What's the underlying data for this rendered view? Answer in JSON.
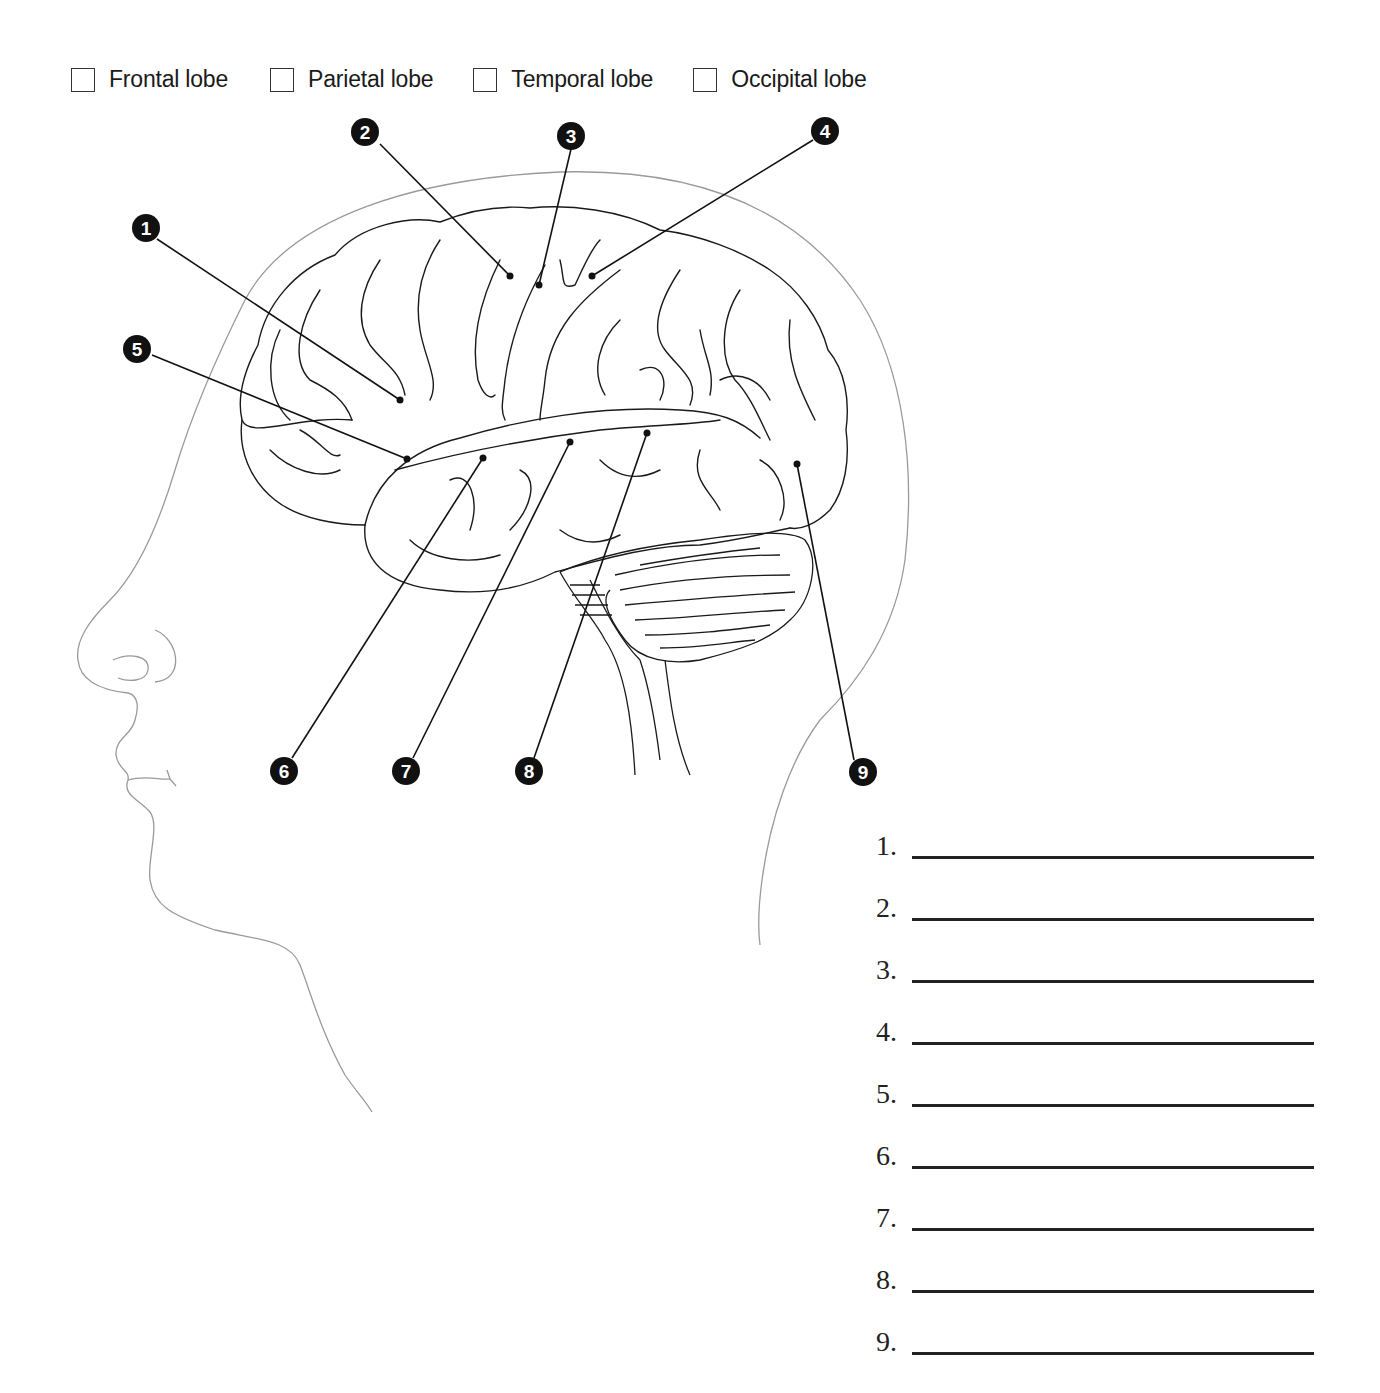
{
  "legend": {
    "items": [
      {
        "label": "Frontal lobe",
        "checked": false
      },
      {
        "label": "Parietal lobe",
        "checked": false
      },
      {
        "label": "Temporal lobe",
        "checked": false
      },
      {
        "label": "Occipital lobe",
        "checked": false
      }
    ]
  },
  "diagram": {
    "callouts": [
      {
        "number": "1",
        "marker": [
          400,
          400
        ],
        "label_pos": [
          146,
          228
        ]
      },
      {
        "number": "2",
        "marker": [
          510,
          276
        ],
        "label_pos": [
          365,
          132
        ]
      },
      {
        "number": "3",
        "marker": [
          539,
          285
        ],
        "label_pos": [
          571,
          136
        ]
      },
      {
        "number": "4",
        "marker": [
          592,
          276
        ],
        "label_pos": [
          825,
          131
        ]
      },
      {
        "number": "5",
        "marker": [
          407,
          459
        ],
        "label_pos": [
          137,
          349
        ]
      },
      {
        "number": "6",
        "marker": [
          483,
          458
        ],
        "label_pos": [
          284,
          771
        ]
      },
      {
        "number": "7",
        "marker": [
          570,
          442
        ],
        "label_pos": [
          406,
          771
        ]
      },
      {
        "number": "8",
        "marker": [
          647,
          433
        ],
        "label_pos": [
          529,
          771
        ]
      },
      {
        "number": "9",
        "marker": [
          797,
          464
        ],
        "label_pos": [
          863,
          772
        ]
      }
    ],
    "colors": {
      "line": "#1a1a1a",
      "head_outline": "#999999",
      "callout_fill": "#111111"
    }
  },
  "answers": {
    "rows": [
      {
        "number": "1.",
        "value": ""
      },
      {
        "number": "2.",
        "value": ""
      },
      {
        "number": "3.",
        "value": ""
      },
      {
        "number": "4.",
        "value": ""
      },
      {
        "number": "5.",
        "value": ""
      },
      {
        "number": "6.",
        "value": ""
      },
      {
        "number": "7.",
        "value": ""
      },
      {
        "number": "8.",
        "value": ""
      },
      {
        "number": "9.",
        "value": ""
      }
    ]
  }
}
